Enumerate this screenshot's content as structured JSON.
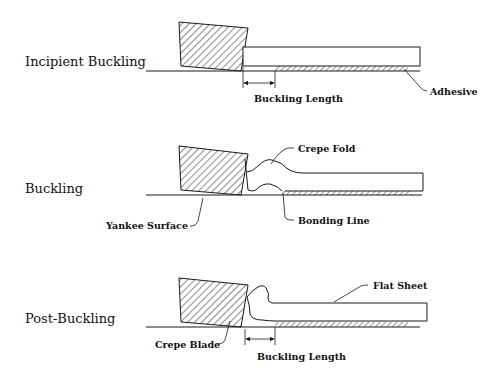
{
  "diagram": {
    "type": "schematic",
    "colors": {
      "line": "#1a1a1a",
      "background": "#ffffff"
    },
    "panels": [
      {
        "id": "incipient",
        "title": "Incipient Buckling",
        "annotations": {
          "dimension": "Buckling Length",
          "adhesive": "Adhesive"
        }
      },
      {
        "id": "buckling",
        "title": "Buckling",
        "annotations": {
          "crepe_fold": "Crepe Fold",
          "bonding_line": "Bonding Line",
          "yankee_surface": "Yankee Surface"
        }
      },
      {
        "id": "post",
        "title": "Post-Buckling",
        "annotations": {
          "flat_sheet": "Flat Sheet",
          "crepe_blade": "Crepe Blade",
          "dimension": "Buckling Length"
        }
      }
    ]
  }
}
